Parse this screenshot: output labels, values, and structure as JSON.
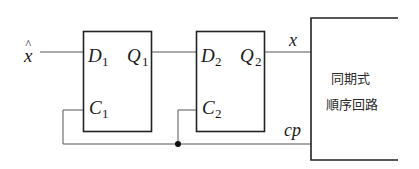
{
  "diagram": {
    "input": {
      "label": "x̂",
      "base": "x",
      "accent": "^"
    },
    "flipflop1": {
      "d": "D",
      "d_sub": "1",
      "q": "Q",
      "q_sub": "1",
      "c": "C",
      "c_sub": "1"
    },
    "flipflop2": {
      "d": "D",
      "d_sub": "2",
      "q": "Q",
      "q_sub": "2",
      "c": "C",
      "c_sub": "2"
    },
    "signals": {
      "x": "x",
      "cp": "cp"
    },
    "circuit_block": {
      "line1": "同期式",
      "line2": "順序回路"
    },
    "colors": {
      "line": "#333333",
      "background": "#ffffff"
    }
  }
}
